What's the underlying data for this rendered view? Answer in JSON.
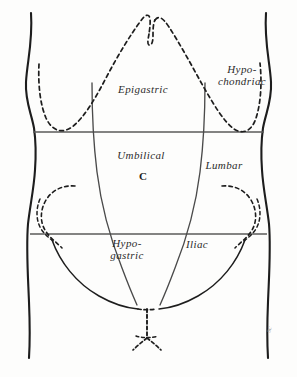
{
  "figure": {
    "background_color": "#fdfdfc",
    "ink_color": "#1d1d1d",
    "plane_color": "#5a5a5a"
  },
  "labels": {
    "epigastric": "Epigastric",
    "hypochondriac_line1": "Hypo-",
    "hypochondriac_line2": "chondriac",
    "umbilical": "Umbilical",
    "lumbar": "Lumbar",
    "hypogastric_line1": "Hypo-",
    "hypogastric_line2": "gastric",
    "iliac": "Iliac"
  },
  "marks": {
    "navel": "C",
    "signature": "sc"
  }
}
